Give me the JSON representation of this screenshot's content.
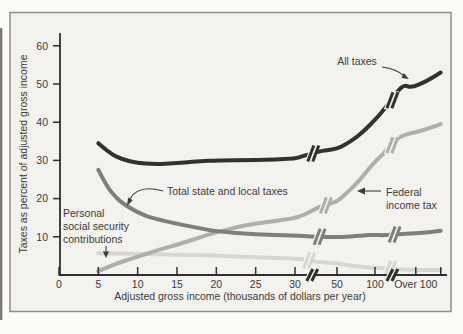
{
  "figure": {
    "paper_color": "#f4f2ee",
    "frame_color": "#8d8d89",
    "ink_color": "#2f2f2f",
    "text_color": "#3b3b3b"
  },
  "chart_data": {
    "type": "line",
    "title": "",
    "xlabel": "Adjusted gross income (thousands of dollars per year)",
    "ylabel": "Taxes as percent of adjusted gross income",
    "x_axis": {
      "ticks": [
        {
          "v": 0,
          "label": "0"
        },
        {
          "v": 5,
          "label": "5"
        },
        {
          "v": 10,
          "label": "10"
        },
        {
          "v": 15,
          "label": "15"
        },
        {
          "v": 20,
          "label": "20"
        },
        {
          "v": 25,
          "label": "25"
        },
        {
          "v": 30,
          "label": "30"
        },
        {
          "v": 50,
          "label": "50"
        },
        {
          "v": 100,
          "label": "100"
        },
        {
          "v": 118,
          "label": "Over 100"
        },
        {
          "v": 129,
          "label": ""
        }
      ],
      "breaks": [
        37.5,
        107
      ],
      "scale_breaks_after_labels": [
        "30",
        "100"
      ]
    },
    "y_axis": {
      "ticks": [
        {
          "v": 10,
          "label": "10"
        },
        {
          "v": 20,
          "label": "20"
        },
        {
          "v": 30,
          "label": "30"
        },
        {
          "v": 40,
          "label": "40"
        },
        {
          "v": 50,
          "label": "50"
        },
        {
          "v": 60,
          "label": "60"
        }
      ],
      "range": [
        0,
        63
      ]
    },
    "series": [
      {
        "id": "personal-social-security",
        "name": "Personal social security contributions",
        "color": "#d8d6d2",
        "breaks": [
          36,
          106
        ],
        "points": [
          [
            5,
            5.7
          ],
          [
            10,
            5.6
          ],
          [
            15,
            5.3
          ],
          [
            20,
            5.1
          ],
          [
            25,
            4.6
          ],
          [
            30,
            4.3
          ],
          [
            34,
            4.0
          ],
          [
            41,
            3.4
          ],
          [
            50,
            3.0
          ],
          [
            62,
            2.6
          ],
          [
            74,
            2.3
          ],
          [
            88,
            2.0
          ],
          [
            100,
            1.9
          ],
          [
            110,
            1.5
          ],
          [
            118,
            1.3
          ],
          [
            129,
            1.3
          ]
        ]
      },
      {
        "id": "federal-income-tax",
        "name": "Federal income tax",
        "color": "#aeaeac",
        "breaks": [
          44,
          107
        ],
        "points": [
          [
            5,
            1.0
          ],
          [
            7,
            2.8
          ],
          [
            10,
            4.8
          ],
          [
            13,
            6.8
          ],
          [
            15,
            7.9
          ],
          [
            18,
            9.9
          ],
          [
            20,
            11.2
          ],
          [
            23,
            12.7
          ],
          [
            25,
            13.5
          ],
          [
            28,
            14.3
          ],
          [
            30,
            14.9
          ],
          [
            33,
            15.5
          ],
          [
            36,
            16.2
          ],
          [
            41,
            17.7
          ],
          [
            45,
            18.4
          ],
          [
            50,
            19.2
          ],
          [
            60,
            21.0
          ],
          [
            74,
            23.5
          ],
          [
            88,
            26.8
          ],
          [
            100,
            29.7
          ],
          [
            104,
            31.8
          ],
          [
            110,
            36.2
          ],
          [
            118,
            37.4
          ],
          [
            124,
            38.4
          ],
          [
            129,
            39.5
          ]
        ]
      },
      {
        "id": "state-local-taxes",
        "name": "Total state and local taxes",
        "color": "#7e7e7c",
        "breaks": [
          41,
          108
        ],
        "points": [
          [
            5,
            27.5
          ],
          [
            6,
            23.5
          ],
          [
            7,
            20.8
          ],
          [
            8,
            18.9
          ],
          [
            10,
            16.3
          ],
          [
            12,
            14.8
          ],
          [
            15,
            13.4
          ],
          [
            18,
            12.2
          ],
          [
            20,
            11.4
          ],
          [
            25,
            10.6
          ],
          [
            30,
            10.3
          ],
          [
            34,
            10.2
          ],
          [
            41,
            10.0
          ],
          [
            50,
            9.9
          ],
          [
            62,
            10.0
          ],
          [
            74,
            10.2
          ],
          [
            88,
            10.4
          ],
          [
            100,
            10.5
          ],
          [
            104,
            10.4
          ],
          [
            110,
            10.7
          ],
          [
            118,
            10.9
          ],
          [
            124,
            11.2
          ],
          [
            129,
            11.6
          ]
        ]
      },
      {
        "id": "all-taxes",
        "name": "All taxes",
        "color": "#313131",
        "breaks": [
          38,
          107
        ],
        "points": [
          [
            5,
            34.5
          ],
          [
            6.5,
            31.8
          ],
          [
            8,
            30.3
          ],
          [
            10,
            29.3
          ],
          [
            12,
            29.0
          ],
          [
            14,
            29.1
          ],
          [
            16,
            29.5
          ],
          [
            18,
            29.8
          ],
          [
            20,
            30.0
          ],
          [
            25,
            30.1
          ],
          [
            30,
            30.4
          ],
          [
            33,
            31.0
          ],
          [
            36,
            31.5
          ],
          [
            41,
            32.3
          ],
          [
            45,
            32.7
          ],
          [
            50,
            33.0
          ],
          [
            62,
            34.3
          ],
          [
            74,
            35.8
          ],
          [
            88,
            38.2
          ],
          [
            100,
            40.6
          ],
          [
            104,
            43.3
          ],
          [
            110,
            48.2
          ],
          [
            113,
            49.8
          ],
          [
            116,
            49.0
          ],
          [
            123,
            50.8
          ],
          [
            129,
            53.0
          ]
        ]
      }
    ],
    "annotations": {
      "all_taxes": {
        "label": "All taxes"
      },
      "federal": {
        "line1": "Federal",
        "line2": "income tax"
      },
      "state_local": {
        "label": "Total state and local taxes"
      },
      "personal": {
        "line1": "Personal",
        "line2": "social security",
        "line3": "contributions"
      }
    }
  }
}
